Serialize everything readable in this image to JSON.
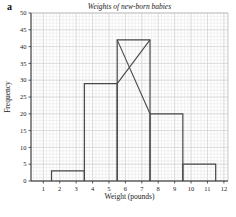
{
  "figure": {
    "panel_label": "a"
  },
  "chart_data": {
    "type": "bar",
    "subtype": "histogram",
    "title": "Weights of new-born babies",
    "xlabel": "Weight (pounds)",
    "ylabel": "Frequency",
    "bins": [
      {
        "range": [
          1.5,
          3.5
        ],
        "frequency": 3
      },
      {
        "range": [
          3.5,
          5.5
        ],
        "frequency": 29
      },
      {
        "range": [
          5.5,
          7.5
        ],
        "frequency": 42
      },
      {
        "range": [
          7.5,
          9.5
        ],
        "frequency": 20
      },
      {
        "range": [
          9.5,
          11.5
        ],
        "frequency": 5
      }
    ],
    "x_ticks": [
      1,
      2,
      3,
      4,
      5,
      6,
      7,
      8,
      9,
      10,
      11,
      12
    ],
    "y_ticks": [
      0,
      5,
      10,
      15,
      20,
      25,
      30,
      35,
      40,
      45,
      50
    ],
    "xlim": [
      0.25,
      12.25
    ],
    "ylim": [
      0,
      50
    ],
    "grid": true,
    "grid_minor_step_x": 0.2,
    "grid_minor_step_y": 1,
    "mode_construction_lines": [
      {
        "from": [
          5.5,
          42
        ],
        "to": [
          7.5,
          20
        ]
      },
      {
        "from": [
          5.5,
          29
        ],
        "to": [
          7.5,
          42
        ]
      }
    ],
    "colors": {
      "background": "#ffffff",
      "grid_minor": "#e4e4e4",
      "grid_major": "#cfcfcf",
      "frame": "#b8b8b8",
      "axis": "#333333",
      "bar_stroke": "#474747",
      "text": "#222222"
    }
  }
}
